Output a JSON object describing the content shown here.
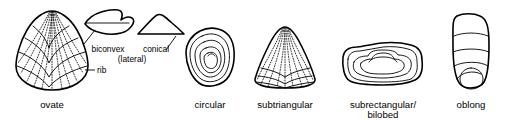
{
  "figure": {
    "background_color": "#ffffff",
    "line_color": "#000000"
  },
  "specimens": [
    {
      "id": "ovate",
      "label": "ovate",
      "icon": "ovate-shell-icon",
      "annotation": {
        "label": "rib",
        "icon": "rib-leader-icon"
      }
    },
    {
      "id": "biconvex",
      "label": "biconvex",
      "icon": "biconvex-lens-icon"
    },
    {
      "id": "conical",
      "label": "conical",
      "sublabel": "(lateral)",
      "icon": "conical-triangle-icon"
    },
    {
      "id": "circular",
      "label": "circular",
      "icon": "circular-shell-icon"
    },
    {
      "id": "subtriangular",
      "label": "subtriangular",
      "icon": "subtriangular-shell-icon"
    },
    {
      "id": "subrectangular",
      "label": "subrectangular/",
      "sublabel": "bilobed",
      "icon": "subrectangular-bilobed-shell-icon"
    },
    {
      "id": "oblong",
      "label": "oblong",
      "icon": "oblong-shell-icon"
    }
  ]
}
